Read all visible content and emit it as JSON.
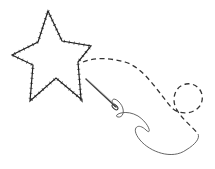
{
  "illustration": {
    "title": "Star stitched outline with needle and thread",
    "colors": {
      "background": "#ffffff",
      "stroke": "#333333",
      "thread": "#555555"
    },
    "elements": [
      "star-icon",
      "dashed-stitch-path",
      "needle-icon",
      "thread-loop"
    ]
  }
}
